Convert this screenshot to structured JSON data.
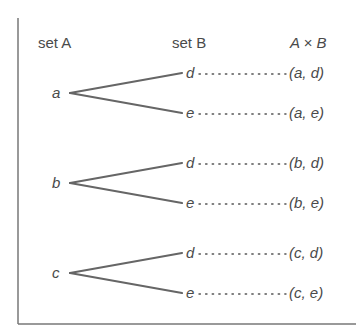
{
  "headers": {
    "set_a": "set A",
    "set_b": "set B",
    "product": "A × B"
  },
  "colors": {
    "line": "#666666",
    "text": "#4a4a4a",
    "border": "#777777"
  },
  "groups": [
    {
      "a_element": "a",
      "branches": [
        {
          "b_element": "d",
          "pair": "(a, d)"
        },
        {
          "b_element": "e",
          "pair": "(a, e)"
        }
      ]
    },
    {
      "a_element": "b",
      "branches": [
        {
          "b_element": "d",
          "pair": "(b, d)"
        },
        {
          "b_element": "e",
          "pair": "(b, e)"
        }
      ]
    },
    {
      "a_element": "c",
      "branches": [
        {
          "b_element": "d",
          "pair": "(c, d)"
        },
        {
          "b_element": "e",
          "pair": "(c, e)"
        }
      ]
    }
  ]
}
